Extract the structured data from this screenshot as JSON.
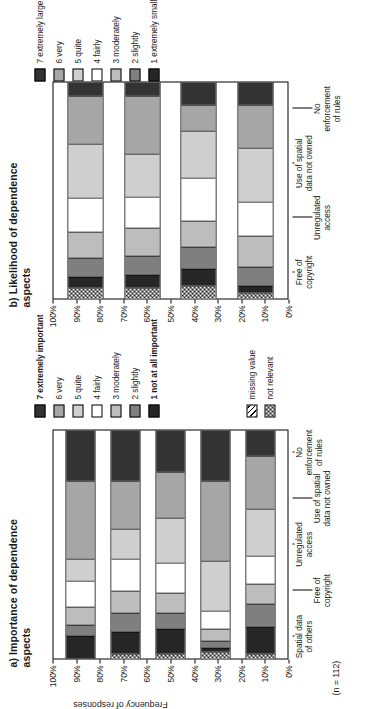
{
  "figure": {
    "sample_note": "(n = 112)",
    "y_axis_title": "Frequency of responses",
    "y_ticks": [
      "100%",
      "90%",
      "80%",
      "70%",
      "60%",
      "50%",
      "40%",
      "30%",
      "20%",
      "10%",
      "0%"
    ],
    "extra_legend": [
      {
        "label": "missing value",
        "pattern": "missing"
      },
      {
        "label": "not relevant",
        "pattern": "notrel"
      }
    ]
  },
  "panels": [
    {
      "id": "a",
      "title": "a) Importance of\ndependence aspects",
      "legend_title": "",
      "legend": [
        {
          "level": 7,
          "label": "7 extremely important",
          "color": "#333333",
          "bold": true
        },
        {
          "level": 6,
          "label": "6 very",
          "color": "#a6a6a6",
          "bold": false
        },
        {
          "level": 5,
          "label": "5 quite",
          "color": "#cfcfcf",
          "bold": false
        },
        {
          "level": 4,
          "label": "4 fairly",
          "color": "#ffffff",
          "bold": false
        },
        {
          "level": 3,
          "label": "3 moderately",
          "color": "#bdbdbd",
          "bold": false
        },
        {
          "level": 2,
          "label": "2 slightly",
          "color": "#7f7f7f",
          "bold": false
        },
        {
          "level": 1,
          "label": "1 not at all important",
          "color": "#262626",
          "bold": true
        }
      ],
      "categories": [
        "Spatial data\nof others",
        "Free of\ncopyright",
        "Unregulated\naccess",
        "Use of spatial\ndata not owned",
        "No enforcement\nof rules"
      ]
    },
    {
      "id": "b",
      "title": "b) Likelihood of\ndependence aspects",
      "legend_title": "",
      "legend": [
        {
          "level": 7,
          "label": "7 extremely large",
          "color": "#333333",
          "bold": false
        },
        {
          "level": 6,
          "label": "6 very",
          "color": "#a6a6a6",
          "bold": false
        },
        {
          "level": 5,
          "label": "5 quite",
          "color": "#cfcfcf",
          "bold": false
        },
        {
          "level": 4,
          "label": "4 fairly",
          "color": "#ffffff",
          "bold": false
        },
        {
          "level": 3,
          "label": "3 moderately",
          "color": "#bdbdbd",
          "bold": false
        },
        {
          "level": 2,
          "label": "2 slightly",
          "color": "#7f7f7f",
          "bold": false
        },
        {
          "level": 1,
          "label": "1 extremely small",
          "color": "#262626",
          "bold": false
        }
      ],
      "categories": [
        "Free of\ncopyright",
        "Unregulated\naccess",
        "Use of spatial\ndata not owned",
        "No enforcement\nof rules"
      ]
    }
  ],
  "chart_data": [
    {
      "type": "bar",
      "subtype": "stacked-percent-horizontal",
      "panel": "a",
      "title": "a) Importance of dependence aspects",
      "xlabel": "",
      "ylabel": "Frequency of responses",
      "ylim": [
        0,
        100
      ],
      "ytick_step": 10,
      "grid": false,
      "legend_position": "right",
      "note": "(n = 112)",
      "categories": [
        "Spatial data of others",
        "Free of copyright",
        "Unregulated access",
        "Use of spatial data not owned",
        "No enforcement of rules"
      ],
      "series": [
        {
          "name": "not relevant",
          "values": [
            0,
            2,
            2,
            3,
            2
          ]
        },
        {
          "name": "1 not at all important",
          "values": [
            10,
            10,
            11,
            2,
            12
          ]
        },
        {
          "name": "2 slightly",
          "values": [
            5,
            8,
            7,
            3,
            10
          ]
        },
        {
          "name": "3 moderately",
          "values": [
            8,
            10,
            9,
            5,
            9
          ]
        },
        {
          "name": "4 fairly",
          "values": [
            11,
            14,
            13,
            8,
            12
          ]
        },
        {
          "name": "5 quite",
          "values": [
            10,
            13,
            20,
            22,
            21
          ]
        },
        {
          "name": "6 very",
          "values": [
            34,
            21,
            20,
            35,
            23
          ]
        },
        {
          "name": "7 extremely important",
          "values": [
            22,
            22,
            18,
            22,
            11
          ]
        }
      ]
    },
    {
      "type": "bar",
      "subtype": "stacked-percent-horizontal",
      "panel": "b",
      "title": "b) Likelihood of dependence aspects",
      "xlabel": "",
      "ylabel": "Frequency of responses",
      "ylim": [
        0,
        100
      ],
      "ytick_step": 10,
      "grid": false,
      "legend_position": "right",
      "categories": [
        "Free of copyright",
        "Unregulated access",
        "Use of spatial data not owned",
        "No enforcement of rules"
      ],
      "series": [
        {
          "name": "not relevant",
          "values": [
            5,
            5,
            6,
            3
          ]
        },
        {
          "name": "1 extremely small",
          "values": [
            5,
            6,
            8,
            3
          ]
        },
        {
          "name": "2 slightly",
          "values": [
            9,
            9,
            10,
            9
          ]
        },
        {
          "name": "3 moderately",
          "values": [
            12,
            13,
            12,
            14
          ]
        },
        {
          "name": "4 fairly",
          "values": [
            16,
            14,
            20,
            16
          ]
        },
        {
          "name": "5 quite",
          "values": [
            25,
            20,
            22,
            25
          ]
        },
        {
          "name": "6 very",
          "values": [
            22,
            27,
            12,
            20
          ]
        },
        {
          "name": "7 extremely large",
          "values": [
            6,
            6,
            10,
            10
          ]
        }
      ]
    }
  ]
}
